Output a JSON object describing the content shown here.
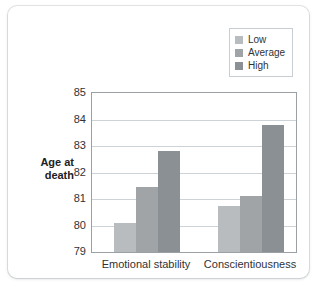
{
  "chart_data": {
    "type": "bar",
    "title": "",
    "xlabel": "",
    "ylabel": "Age at death",
    "ylabel_line1": "Age at",
    "ylabel_line2": "death",
    "categories": [
      "Emotional stability",
      "Conscientiousness"
    ],
    "series": [
      {
        "name": "Low",
        "color": "#b9bcbe",
        "values": [
          80.1,
          80.75
        ]
      },
      {
        "name": "Average",
        "color": "#a0a4a7",
        "values": [
          81.45,
          81.1
        ]
      },
      {
        "name": "High",
        "color": "#8b9094",
        "values": [
          82.8,
          83.8
        ]
      }
    ],
    "ylim": [
      79,
      85
    ],
    "yticks": [
      "85",
      "84",
      "83",
      "82",
      "81",
      "80",
      "79"
    ],
    "ytick_values": [
      85,
      84,
      83,
      82,
      81,
      80,
      79
    ],
    "grid": true,
    "legend_position": "top-right"
  },
  "legend": {
    "items": [
      {
        "label": "Low"
      },
      {
        "label": "Average"
      },
      {
        "label": "High"
      }
    ]
  }
}
